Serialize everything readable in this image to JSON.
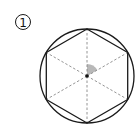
{
  "figure": {
    "label": "①",
    "label_numeral": "1",
    "shape": {
      "circle": {
        "cx": 87,
        "cy": 76,
        "r": 47
      },
      "hexagon": {
        "circumradius": 47,
        "vertex_count": 6
      },
      "radii_style": "dashed",
      "shaded_angle": {
        "from_deg": 30,
        "to_deg": 90,
        "radius": 12,
        "measure_deg": 60
      },
      "center_point": true
    },
    "colors": {
      "stroke": "#1a1a1a",
      "dashed": "#888888",
      "shade": "#b8b8b8",
      "background": "#ffffff"
    }
  }
}
